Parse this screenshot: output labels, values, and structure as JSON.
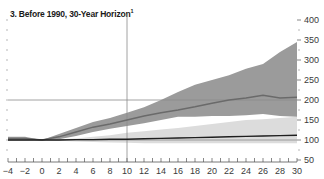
{
  "chart_data": {
    "type": "area",
    "title": "3. Before 1990, 30-Year Horizon",
    "title_footnote": "1",
    "xlabel": "",
    "ylabel": "",
    "xlim": [
      -4,
      30
    ],
    "ylim": [
      50,
      400
    ],
    "x_ticks": [
      -4,
      -2,
      0,
      2,
      4,
      6,
      8,
      10,
      12,
      14,
      16,
      18,
      20,
      22,
      24,
      26,
      28,
      30
    ],
    "y_ticks": [
      50,
      100,
      150,
      200,
      250,
      300,
      350,
      400
    ],
    "y_axis_position": "right",
    "grid": false,
    "reference_lines": {
      "vertical_x": 10,
      "horizontal_y": 200,
      "horizontal_y_base": 100
    },
    "x": [
      -4,
      -2,
      0,
      2,
      4,
      6,
      8,
      10,
      12,
      14,
      16,
      18,
      20,
      22,
      24,
      26,
      28,
      30
    ],
    "series": [
      {
        "name": "Upper band (high)",
        "role": "dark-band-upper",
        "values": [
          108,
          108,
          100,
          115,
          130,
          145,
          155,
          168,
          182,
          200,
          220,
          238,
          250,
          262,
          278,
          290,
          320,
          345
        ]
      },
      {
        "name": "Upper band (low)",
        "role": "dark-band-lower",
        "values": [
          100,
          100,
          100,
          102,
          110,
          120,
          128,
          135,
          142,
          150,
          158,
          158,
          160,
          160,
          162,
          165,
          160,
          158
        ]
      },
      {
        "name": "Upper median",
        "role": "dark-line",
        "values": [
          104,
          104,
          100,
          108,
          120,
          132,
          140,
          150,
          160,
          168,
          175,
          183,
          192,
          200,
          205,
          212,
          205,
          207
        ]
      },
      {
        "name": "Lower band (high)",
        "role": "light-band-upper",
        "values": [
          100,
          100,
          100,
          102,
          104,
          108,
          112,
          118,
          122,
          126,
          130,
          135,
          140,
          145,
          150,
          152,
          155,
          158
        ]
      },
      {
        "name": "Lower band (low)",
        "role": "light-band-lower",
        "values": [
          98,
          98,
          100,
          98,
          96,
          95,
          94,
          93,
          92,
          92,
          92,
          92,
          92,
          92,
          92,
          92,
          92,
          92
        ]
      },
      {
        "name": "Lower median",
        "role": "black-line",
        "values": [
          100,
          100,
          100,
          100,
          101,
          101,
          102,
          102,
          103,
          104,
          105,
          106,
          107,
          108,
          109,
          110,
          111,
          112
        ]
      }
    ]
  },
  "title": {
    "text": "3. Before 1990, 30-Year Horizon",
    "footnote": "1"
  },
  "colors": {
    "dark_band": "#9b9b9b",
    "light_band": "#dcdcdc",
    "dark_line": "#6a6a6a",
    "black_line": "#1e1e1e",
    "reference_line": "#8a8a8a",
    "text": "#3a3a3a"
  }
}
